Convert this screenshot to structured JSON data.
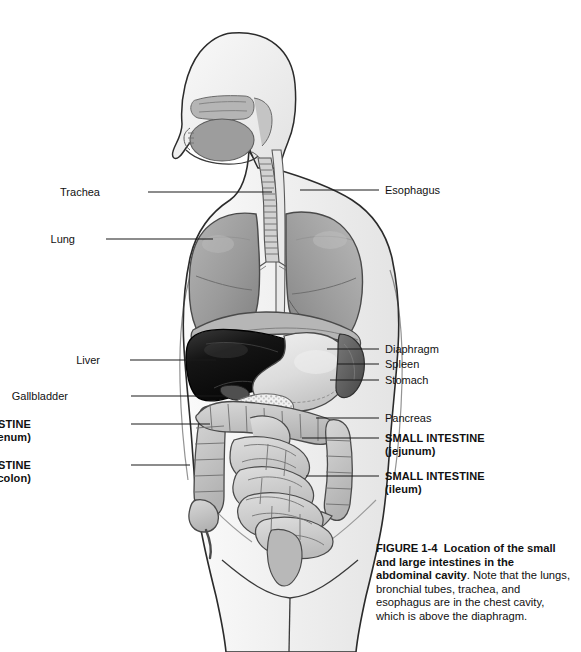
{
  "figure": {
    "id": "FIGURE 1-4",
    "title": "Location of the small and large intestines in the abdominal cavity",
    "caption_rest": ". Note that the lungs, bronchial tubes, trachea, and esophagus are in the chest cavity, which is above the diaphragm.",
    "background_color": "#ffffff",
    "line_color": "#1a1a1a"
  },
  "labels": {
    "left": [
      {
        "name": "trachea",
        "text": "Trachea",
        "sub": "",
        "bold": false,
        "x": 100,
        "y": 186,
        "line_from_x": 148,
        "line_to_x": 272,
        "line_y": 192
      },
      {
        "name": "lung",
        "text": "Lung",
        "sub": "",
        "bold": false,
        "x": 75,
        "y": 233,
        "line_from_x": 106,
        "line_to_x": 213,
        "line_y": 239
      },
      {
        "name": "liver",
        "text": "Liver",
        "sub": "",
        "bold": false,
        "x": 100,
        "y": 354,
        "line_from_x": 130,
        "line_to_x": 216,
        "line_y": 360
      },
      {
        "name": "gallbladder",
        "text": "Gallbladder",
        "sub": "",
        "bold": false,
        "x": 68,
        "y": 390,
        "line_from_x": 131,
        "line_to_x": 224,
        "line_y": 396
      },
      {
        "name": "small-intestine-duodenum",
        "text": "SMALL INTESTINE",
        "sub": "(duodenum)",
        "bold": true,
        "x": 31,
        "y": 418,
        "line_from_x": 131,
        "line_to_x": 210,
        "line_y": 424
      },
      {
        "name": "large-intestine-colon",
        "text": "LARGE INTESTINE",
        "sub": "(colon)",
        "bold": true,
        "x": 31,
        "y": 459,
        "line_from_x": 131,
        "line_to_x": 190,
        "line_y": 465
      }
    ],
    "right": [
      {
        "name": "esophagus",
        "text": "Esophagus",
        "sub": "",
        "bold": false,
        "x": 385,
        "y": 184,
        "line_from_x": 300,
        "line_to_x": 379,
        "line_y": 190
      },
      {
        "name": "diaphragm",
        "text": "Diaphragm",
        "sub": "",
        "bold": false,
        "x": 385,
        "y": 343,
        "line_from_x": 327,
        "line_to_x": 379,
        "line_y": 349
      },
      {
        "name": "spleen",
        "text": "Spleen",
        "sub": "",
        "bold": false,
        "x": 385,
        "y": 358,
        "line_from_x": 337,
        "line_to_x": 379,
        "line_y": 364
      },
      {
        "name": "stomach",
        "text": "Stomach",
        "sub": "",
        "bold": false,
        "x": 385,
        "y": 374,
        "line_from_x": 330,
        "line_to_x": 379,
        "line_y": 380
      },
      {
        "name": "pancreas",
        "text": "Pancreas",
        "sub": "",
        "bold": false,
        "x": 385,
        "y": 412,
        "line_from_x": 316,
        "line_to_x": 379,
        "line_y": 418
      },
      {
        "name": "small-intestine-jejunum",
        "text": "SMALL INTESTINE",
        "sub": "(jejunum)",
        "bold": true,
        "x": 385,
        "y": 432,
        "line_from_x": 302,
        "line_to_x": 379,
        "line_y": 438
      },
      {
        "name": "small-intestine-ileum",
        "text": "SMALL INTESTINE",
        "sub": "(ileum)",
        "bold": true,
        "x": 385,
        "y": 470,
        "line_from_x": 306,
        "line_to_x": 379,
        "line_y": 476
      }
    ]
  },
  "organs": [
    {
      "name": "body-outline",
      "fill": "#f2f2f2",
      "stroke": "#2b2b2b"
    },
    {
      "name": "head-profile",
      "fill": "#ededed",
      "stroke": "#2b2b2b"
    },
    {
      "name": "nasal-cavity",
      "fill": "#b8b8b8",
      "stroke": "#6a6a6a"
    },
    {
      "name": "oral-cavity",
      "fill": "#9d9d9d",
      "stroke": "#5c5c5c"
    },
    {
      "name": "lung-left",
      "fill": "#9a9a9a",
      "stroke": "#4a4a4a"
    },
    {
      "name": "lung-right",
      "fill": "#9a9a9a",
      "stroke": "#4a4a4a"
    },
    {
      "name": "trachea",
      "fill": "#cfcfcf",
      "stroke": "#555555"
    },
    {
      "name": "esophagus",
      "fill": "#e6e6e6",
      "stroke": "#555555"
    },
    {
      "name": "diaphragm",
      "fill": "#b0b0b0",
      "stroke": "#4a4a4a"
    },
    {
      "name": "liver",
      "fill": "#151515",
      "stroke": "#000000"
    },
    {
      "name": "gallbladder",
      "fill": "#4d4d4d",
      "stroke": "#1f1f1f"
    },
    {
      "name": "stomach",
      "fill": "#dcdcdc",
      "stroke": "#4a4a4a"
    },
    {
      "name": "spleen",
      "fill": "#5e5e5e",
      "stroke": "#2f2f2f"
    },
    {
      "name": "pancreas",
      "fill": "#ebebeb",
      "stroke": "#6a6a6a"
    },
    {
      "name": "large-intestine",
      "fill": "#c2c2c2",
      "stroke": "#4a4a4a"
    },
    {
      "name": "small-intestine",
      "fill": "#cbcbcb",
      "stroke": "#4a4a4a"
    },
    {
      "name": "bladder",
      "fill": "#b4b4b4",
      "stroke": "#4a4a4a"
    }
  ]
}
